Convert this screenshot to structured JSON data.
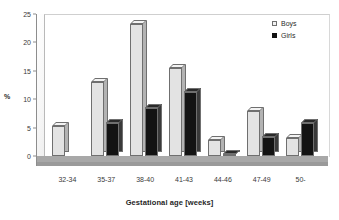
{
  "chart_data": {
    "type": "bar",
    "title": "",
    "xlabel": "Gestational age [weeks]",
    "ylabel": "%",
    "categories": [
      "32-34",
      "35-37",
      "38-40",
      "41-43",
      "44-46",
      "47-49",
      "50-"
    ],
    "series": [
      {
        "name": "Boys",
        "values": [
          5.2,
          13.0,
          23.2,
          15.5,
          2.9,
          8.0,
          3.1
        ]
      },
      {
        "name": "Girls",
        "values": [
          0.0,
          5.8,
          8.4,
          11.2,
          0.4,
          3.4,
          5.8
        ]
      }
    ],
    "ylim": [
      0,
      25
    ],
    "yticks": [
      0,
      5,
      10,
      15,
      20,
      25
    ],
    "ytick_labels": [
      "0",
      "5",
      "10",
      "15",
      "20",
      "25"
    ],
    "grid": false,
    "legend_position": "top-right",
    "legend_entries": [
      "Boys",
      "Girls"
    ],
    "colors": {
      "boys_face": "#e3e3e3",
      "boys_side": "#b3b3b3",
      "girls_face": "#131313",
      "girls_side": "#3a3a3a",
      "floor": "#a8a8a8",
      "axis": "#8d8d8d",
      "text": "#2a2a2a"
    },
    "style": "3d-column"
  }
}
